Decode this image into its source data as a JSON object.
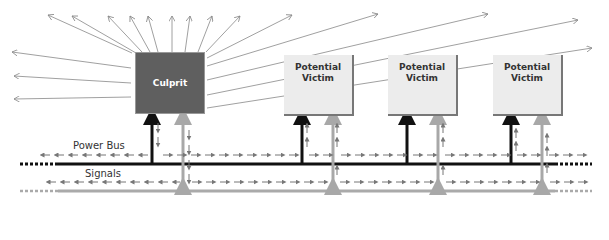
{
  "diagram": {
    "culprit": {
      "label": "Culprit",
      "color": "#5f5f5f"
    },
    "victims": [
      {
        "label": "Potential\nVictim"
      },
      {
        "label": "Potential\nVictim"
      },
      {
        "label": "Potential\nVictim"
      }
    ],
    "labels": {
      "power_bus": "Power Bus",
      "signals": "Signals"
    },
    "colors": {
      "power_bus": "#111111",
      "signals": "#a8a8a8",
      "noise_arrows": "#777777",
      "radiation": "#888888"
    }
  }
}
